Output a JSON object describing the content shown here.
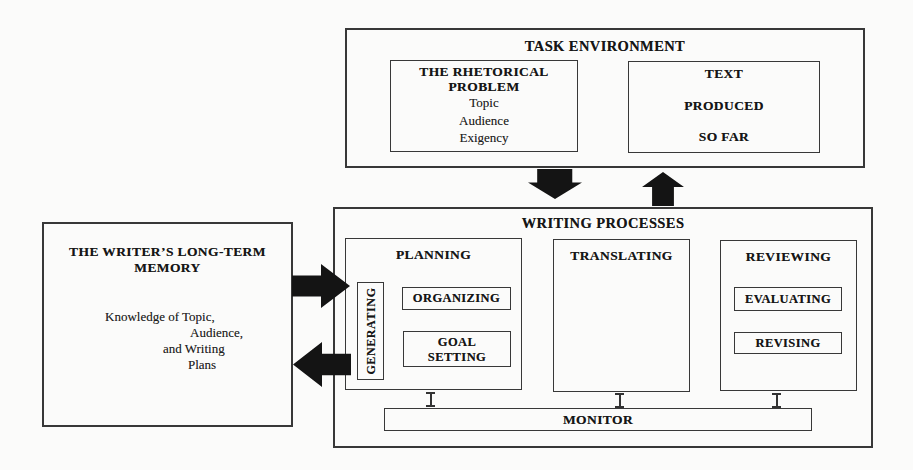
{
  "colors": {
    "paper_background": "#fbfbfa",
    "box_line": "#383838",
    "arrow_fill": "#141414",
    "text": "#1d1d1d"
  },
  "task_environment": {
    "title": "TASK ENVIRONMENT",
    "rhetorical_problem": {
      "title_lines": [
        "THE RHETORICAL",
        "PROBLEM"
      ],
      "items": [
        "Topic",
        "Audience",
        "Exigency"
      ]
    },
    "text_produced": {
      "lines": [
        "TEXT",
        "PRODUCED",
        "SO FAR"
      ]
    }
  },
  "long_term_memory": {
    "title_lines": [
      "THE WRITER’S LONG-TERM",
      "MEMORY"
    ],
    "body_lines": [
      "Knowledge of Topic,",
      "Audience,",
      "and Writing",
      "Plans"
    ]
  },
  "writing_processes": {
    "title": "WRITING PROCESSES",
    "planning": {
      "title": "PLANNING",
      "generating_label": "GENERATING",
      "organizing_label": "ORGANIZING",
      "goal_setting_lines": [
        "GOAL",
        "SETTING"
      ]
    },
    "translating": {
      "title": "TRANSLATING"
    },
    "reviewing": {
      "title": "REVIEWING",
      "evaluating_label": "EVALUATING",
      "revising_label": "REVISING"
    },
    "monitor_label": "MONITOR"
  }
}
